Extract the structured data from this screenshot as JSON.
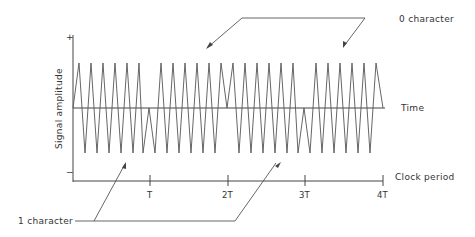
{
  "diagram": {
    "title": "",
    "y_axis": {
      "label": "Signal amplitude",
      "plus": "+",
      "minus": "−"
    },
    "time_axis": {
      "label": "Time"
    },
    "clock_axis": {
      "label": "Clock period",
      "ticks": [
        "T",
        "2T",
        "3T",
        "4T"
      ]
    },
    "annotations": {
      "zero_character": "0 character",
      "one_character": "1 character"
    },
    "colors": {
      "line": "#555555",
      "text": "#333333",
      "background": "#ffffff"
    }
  }
}
